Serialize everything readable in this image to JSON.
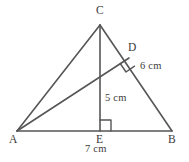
{
  "figure": {
    "type": "geometry-diagram",
    "stroke_color": "#565656",
    "label_color": "#3b3b3b",
    "background_color": "#ffffff",
    "vertices": [
      {
        "id": "A",
        "label": "A",
        "x": 17,
        "y": 131
      },
      {
        "id": "B",
        "label": "B",
        "x": 172,
        "y": 131
      },
      {
        "id": "C",
        "label": "C",
        "x": 100,
        "y": 25
      },
      {
        "id": "D",
        "label": "D",
        "x": 129,
        "y": 58
      },
      {
        "id": "E",
        "label": "E",
        "x": 100,
        "y": 131
      }
    ],
    "segments": [
      {
        "name": "side-AB",
        "from": "A",
        "to": "B"
      },
      {
        "name": "side-AC",
        "from": "A",
        "to": "C"
      },
      {
        "name": "side-CB",
        "from": "C",
        "to": "B"
      },
      {
        "name": "altitude-CE",
        "from": "C",
        "to": "E"
      },
      {
        "name": "altitude-AD",
        "from": "A",
        "to": "D"
      }
    ],
    "right_angles": [
      {
        "name": "right-angle-at-E",
        "at": "E"
      },
      {
        "name": "right-angle-at-D",
        "at": "D"
      }
    ],
    "point_labels": [
      {
        "name": "point-label-C",
        "text": "C",
        "x": 100,
        "y": 11
      },
      {
        "name": "point-label-D",
        "text": "D",
        "x": 132,
        "y": 48
      },
      {
        "name": "point-label-A",
        "text": "A",
        "x": 14,
        "y": 139
      },
      {
        "name": "point-label-E",
        "text": "E",
        "x": 100,
        "y": 139
      },
      {
        "name": "point-label-B",
        "text": "B",
        "x": 172,
        "y": 139
      }
    ],
    "measurements": [
      {
        "name": "measure-AD",
        "text": "6 cm",
        "value": 6,
        "unit": "cm",
        "segment": "altitude-AD",
        "x": 155,
        "y": 67
      },
      {
        "name": "measure-CE",
        "text": "5 cm",
        "value": 5,
        "unit": "cm",
        "segment": "altitude-CE",
        "x": 119,
        "y": 99
      },
      {
        "name": "measure-AB",
        "text": "7 cm",
        "value": 7,
        "unit": "cm",
        "segment": "side-AB",
        "x": 100,
        "y": 152
      }
    ]
  }
}
